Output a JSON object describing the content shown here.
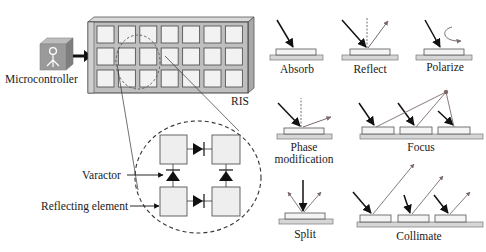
{
  "figure": {
    "left_panel": {
      "microcontroller_label": "Microcontroller",
      "ris_label": "RIS",
      "ris_grid": {
        "rows": 3,
        "cols": 7
      },
      "zoom_view": {
        "varactor_label": "Varactor",
        "reflecting_element_label": "Reflecting element"
      },
      "icon": "microcontroller-icon"
    },
    "right_panel": {
      "functions": [
        {
          "id": "absorb",
          "label": "Absorb"
        },
        {
          "id": "reflect",
          "label": "Reflect"
        },
        {
          "id": "polarize",
          "label": "Polarize"
        },
        {
          "id": "phase",
          "label_line1": "Phase",
          "label_line2": "modification"
        },
        {
          "id": "focus",
          "label": "Focus"
        },
        {
          "id": "split",
          "label": "Split"
        },
        {
          "id": "collimate",
          "label": "Collimate"
        }
      ]
    },
    "colors": {
      "element_fill": "#ececec",
      "element_stroke": "#555555",
      "substrate_fill": "#d6d6d6",
      "incident_ray": "#111111",
      "outgoing_ray": "#7a6a6a",
      "icon_fill": "#9a9a9a",
      "ris_frame": "#bfbfbf"
    }
  }
}
